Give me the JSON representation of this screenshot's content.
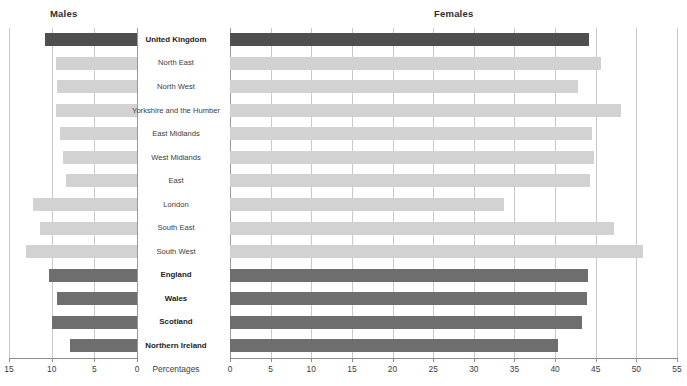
{
  "panels": {
    "left_title": "Males",
    "right_title": "Females",
    "axis_caption": "Percentages"
  },
  "axes": {
    "males": {
      "ticks": [
        15,
        10,
        5,
        0
      ],
      "min": 0,
      "max": 15,
      "reversed": true
    },
    "females": {
      "ticks": [
        0,
        5,
        10,
        15,
        20,
        25,
        30,
        35,
        40,
        45,
        50,
        55
      ],
      "min": 0,
      "max": 55
    }
  },
  "colors": {
    "bar_light": "#d2d2d2",
    "bar_mid": "#b3b3b3",
    "bar_dark": "#6e6e6e",
    "bar_darkest": "#4f4f4f",
    "grid": "#c9c9c9",
    "axis": "#8d8d8d",
    "text": "#3c3c3c"
  },
  "chart_data": {
    "type": "bar",
    "title": "",
    "xlabel": "Percentages",
    "ylabel": "",
    "grid": true,
    "legend": false,
    "orientation": "horizontal-back-to-back",
    "categories": [
      "United Kingdom",
      "North East",
      "North West",
      "Yorkshire and the Humber",
      "East Midlands",
      "West Midlands",
      "East",
      "London",
      "South East",
      "South West",
      "England",
      "Wales",
      "Scotland",
      "Northern Ireland"
    ],
    "category_emphasis": [
      true,
      false,
      false,
      false,
      false,
      false,
      false,
      false,
      false,
      false,
      true,
      true,
      true,
      true
    ],
    "series": [
      {
        "name": "Males",
        "axis": "left",
        "xlim": [
          0,
          15
        ],
        "values": [
          10.8,
          9.5,
          9.4,
          9.5,
          9.0,
          8.7,
          8.3,
          12.2,
          11.4,
          13.0,
          10.3,
          9.4,
          10.0,
          7.8
        ]
      },
      {
        "name": "Females",
        "axis": "right",
        "xlim": [
          0,
          55
        ],
        "values": [
          44.2,
          45.7,
          42.8,
          48.1,
          44.6,
          44.8,
          44.3,
          33.7,
          47.3,
          50.8,
          44.1,
          43.9,
          43.3,
          40.4
        ]
      }
    ]
  }
}
